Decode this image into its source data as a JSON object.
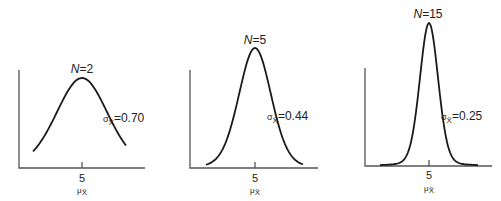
{
  "chart_data": [
    {
      "type": "line",
      "title": "N = 2",
      "n_label": "N",
      "n_value": "2",
      "sigma_label": "σ",
      "sigma_sub": "X̄",
      "sigma_value": "0.70",
      "mean": 5,
      "sd": 0.7,
      "x_tick_labels": [
        "5"
      ],
      "xlabel": "μX̄",
      "mu_label": "μ",
      "mu_sub": "X̄",
      "tick_label": "5",
      "grid": false
    },
    {
      "type": "line",
      "title": "N = 5",
      "n_label": "N",
      "n_value": "5",
      "sigma_label": "σ",
      "sigma_sub": "X̄",
      "sigma_value": "0.44",
      "mean": 5,
      "sd": 0.44,
      "x_tick_labels": [
        "5"
      ],
      "xlabel": "μX̄",
      "mu_label": "μ",
      "mu_sub": "X̄",
      "tick_label": "5",
      "grid": false
    },
    {
      "type": "line",
      "title": "N = 15",
      "n_label": "N",
      "n_value": "15",
      "sigma_label": "σ",
      "sigma_sub": "X̄",
      "sigma_value": "0.25",
      "mean": 5,
      "sd": 0.25,
      "x_tick_labels": [
        "5"
      ],
      "xlabel": "μX̄",
      "mu_label": "μ",
      "mu_sub": "X̄",
      "tick_label": "5",
      "grid": false
    }
  ],
  "equals": "=",
  "colors": {
    "curve": "#1a1a1a",
    "axis": "#555555",
    "background": "#ffffff"
  }
}
